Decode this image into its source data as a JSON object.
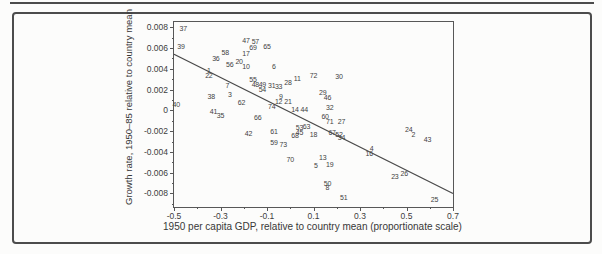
{
  "colors": {
    "frame": "#4c4c4c",
    "axis": "#575757",
    "text": "#3a3a3a",
    "regression_line": "#4a4a4a"
  },
  "chart_data": {
    "type": "scatter",
    "title": "",
    "xlabel": "1950 per capita GDP, relative to country mean (proportionate scale)",
    "ylabel": "Growth rate, 1950–85 relative to country mean",
    "xlim": [
      -0.5,
      0.7
    ],
    "ylim": [
      -0.0093,
      0.0085
    ],
    "grid": false,
    "legend": null,
    "marker_style": "numeric-label",
    "x_major_ticks": [
      -0.5,
      -0.3,
      -0.1,
      0.1,
      0.3,
      0.5,
      0.7
    ],
    "x_major_labels": [
      "-0.5",
      "-0.3",
      "-0.1",
      "0.1",
      "0.3",
      "0.5",
      "0.7"
    ],
    "x_minor_ticks": [
      -0.4,
      -0.2,
      0,
      0.2,
      0.4,
      0.6
    ],
    "y_major_ticks": [
      0.008,
      0.006,
      0.004,
      0.002,
      0,
      -0.002,
      -0.004,
      -0.006,
      -0.008
    ],
    "y_major_labels": [
      "0.008",
      "0.006",
      "0.004",
      "0.002",
      "0",
      "-0.002",
      "-0.004",
      "-0.006",
      "-0.008"
    ],
    "y_minor_ticks": [
      0.007,
      0.005,
      0.003,
      0.001,
      -0.001,
      -0.003,
      -0.005,
      -0.007,
      -0.009
    ],
    "regression_line": {
      "x1": -0.5,
      "y1": 0.0054,
      "x2": 0.7,
      "y2": -0.008
    },
    "points": [
      {
        "label": "1",
        "x": -0.35,
        "y": 0.0039
      },
      {
        "label": "2",
        "x": 0.53,
        "y": -0.0023
      },
      {
        "label": "3",
        "x": -0.26,
        "y": 0.0016
      },
      {
        "label": "4",
        "x": 0.35,
        "y": -0.0036
      },
      {
        "label": "5",
        "x": 0.11,
        "y": -0.0053
      },
      {
        "label": "6",
        "x": -0.07,
        "y": 0.0043
      },
      {
        "label": "7",
        "x": -0.27,
        "y": 0.0024
      },
      {
        "label": "8",
        "x": 0.16,
        "y": -0.0074
      },
      {
        "label": "9",
        "x": -0.04,
        "y": 0.0014
      },
      {
        "label": "10",
        "x": -0.19,
        "y": 0.0043
      },
      {
        "label": "11",
        "x": 0.03,
        "y": 0.0031
      },
      {
        "label": "12",
        "x": -0.05,
        "y": 0.0009
      },
      {
        "label": "13",
        "x": 0.14,
        "y": -0.0045
      },
      {
        "label": "14",
        "x": 0.02,
        "y": 0.0001
      },
      {
        "label": "16",
        "x": 0.34,
        "y": -0.0041
      },
      {
        "label": "17",
        "x": -0.19,
        "y": 0.0055
      },
      {
        "label": "18",
        "x": 0.1,
        "y": -0.0023
      },
      {
        "label": "19",
        "x": 0.17,
        "y": -0.0052
      },
      {
        "label": "20",
        "x": -0.22,
        "y": 0.0047
      },
      {
        "label": "21",
        "x": -0.01,
        "y": 0.0009
      },
      {
        "label": "22",
        "x": -0.35,
        "y": 0.0034
      },
      {
        "label": "23",
        "x": 0.45,
        "y": -0.0063
      },
      {
        "label": "24",
        "x": 0.51,
        "y": -0.0018
      },
      {
        "label": "25",
        "x": 0.62,
        "y": -0.0085
      },
      {
        "label": "26",
        "x": 0.49,
        "y": -0.006
      },
      {
        "label": "27",
        "x": 0.22,
        "y": -0.001
      },
      {
        "label": "28",
        "x": -0.01,
        "y": 0.0027
      },
      {
        "label": "29",
        "x": 0.14,
        "y": 0.0018
      },
      {
        "label": "30",
        "x": 0.21,
        "y": 0.0033
      },
      {
        "label": "31",
        "x": -0.08,
        "y": 0.0024
      },
      {
        "label": "32",
        "x": 0.17,
        "y": 0.0003
      },
      {
        "label": "33",
        "x": -0.05,
        "y": 0.0023
      },
      {
        "label": "34",
        "x": 0.22,
        "y": -0.0026
      },
      {
        "label": "35",
        "x": -0.3,
        "y": -0.0004
      },
      {
        "label": "36",
        "x": -0.32,
        "y": 0.005
      },
      {
        "label": "37",
        "x": -0.46,
        "y": 0.0079
      },
      {
        "label": "38",
        "x": -0.34,
        "y": 0.0014
      },
      {
        "label": "39",
        "x": -0.47,
        "y": 0.0062
      },
      {
        "label": "40",
        "x": -0.49,
        "y": 0.0006
      },
      {
        "label": "41",
        "x": -0.33,
        "y": -0.0001
      },
      {
        "label": "42",
        "x": -0.18,
        "y": -0.0022
      },
      {
        "label": "43",
        "x": 0.59,
        "y": -0.0028
      },
      {
        "label": "44",
        "x": 0.06,
        "y": 0.0001
      },
      {
        "label": "45",
        "x": 0.04,
        "y": -0.0021
      },
      {
        "label": "46",
        "x": 0.16,
        "y": 0.0013
      },
      {
        "label": "47",
        "x": -0.19,
        "y": 0.0068
      },
      {
        "label": "48",
        "x": -0.15,
        "y": 0.0025
      },
      {
        "label": "49",
        "x": -0.12,
        "y": 0.0025
      },
      {
        "label": "50",
        "x": 0.16,
        "y": -0.007
      },
      {
        "label": "51",
        "x": 0.23,
        "y": -0.0083
      },
      {
        "label": "52",
        "x": 0.21,
        "y": -0.0023
      },
      {
        "label": "53",
        "x": 0.04,
        "y": -0.0016
      },
      {
        "label": "54",
        "x": -0.12,
        "y": 0.0021
      },
      {
        "label": "55",
        "x": -0.16,
        "y": 0.003
      },
      {
        "label": "56",
        "x": -0.26,
        "y": 0.0045
      },
      {
        "label": "57",
        "x": -0.15,
        "y": 0.0067
      },
      {
        "label": "58",
        "x": -0.28,
        "y": 0.0056
      },
      {
        "label": "59",
        "x": -0.07,
        "y": -0.003
      },
      {
        "label": "60",
        "x": 0.15,
        "y": -0.0005
      },
      {
        "label": "61",
        "x": -0.07,
        "y": -0.002
      },
      {
        "label": "62",
        "x": -0.21,
        "y": 0.0008
      },
      {
        "label": "63",
        "x": 0.07,
        "y": -0.0015
      },
      {
        "label": "65",
        "x": -0.1,
        "y": 0.0062
      },
      {
        "label": "66",
        "x": -0.14,
        "y": -0.0006
      },
      {
        "label": "67",
        "x": 0.18,
        "y": -0.0021
      },
      {
        "label": "68",
        "x": 0.02,
        "y": -0.0024
      },
      {
        "label": "69",
        "x": -0.16,
        "y": 0.0061
      },
      {
        "label": "70",
        "x": 0.0,
        "y": -0.0047
      },
      {
        "label": "71",
        "x": 0.17,
        "y": -0.001
      },
      {
        "label": "72",
        "x": 0.1,
        "y": 0.0034
      },
      {
        "label": "73",
        "x": -0.03,
        "y": -0.0032
      },
      {
        "label": "74",
        "x": -0.08,
        "y": 0.0004
      }
    ]
  }
}
